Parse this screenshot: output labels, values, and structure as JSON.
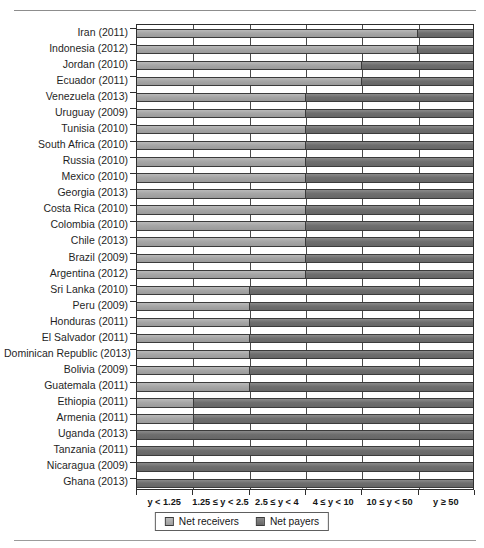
{
  "chart_data": {
    "type": "bar",
    "orientation": "horizontal",
    "stacked": true,
    "title": "",
    "xlabel": "",
    "ylabel": "",
    "grid": true,
    "legend_position": "bottom",
    "categories": [
      "Iran (2011)",
      "Indonesia (2012)",
      "Jordan (2010)",
      "Ecuador (2011)",
      "Venezuela (2013)",
      "Uruguay (2009)",
      "Tunisia (2010)",
      "South Africa (2010)",
      "Russia (2010)",
      "Mexico (2010)",
      "Georgia (2013)",
      "Costa Rica (2010)",
      "Colombia (2010)",
      "Chile (2013)",
      "Brazil (2009)",
      "Argentina (2012)",
      "Sri Lanka (2010)",
      "Peru (2009)",
      "Honduras (2011)",
      "El Salvador (2011)",
      "Dominican Republic (2013)",
      "Bolivia (2009)",
      "Guatemala (2011)",
      "Ethiopia (2011)",
      "Armenia (2011)",
      "Uganda (2013)",
      "Tanzania (2011)",
      "Nicaragua (2009)",
      "Ghana (2013)"
    ],
    "x_tick_labels": [
      "y < 1.25",
      "1.25 ≤ y < 2.5",
      "2.5 ≤ y < 4",
      "4 ≤ y < 10",
      "10 ≤ y < 50",
      "y ≥ 50"
    ],
    "x_band_boundaries": [
      0,
      1,
      2,
      3,
      4,
      5,
      6
    ],
    "xlim": [
      0,
      6
    ],
    "series": [
      {
        "name": "Net receivers",
        "color": "#a6a6a6",
        "values": [
          5,
          5,
          4,
          4,
          3,
          3,
          3,
          3,
          3,
          3,
          3,
          3,
          3,
          3,
          3,
          3,
          2,
          2,
          2,
          2,
          2,
          2,
          2,
          1,
          1,
          0,
          0,
          0,
          0
        ]
      },
      {
        "name": "Net payers",
        "color": "#6e6e6e",
        "values": [
          1,
          1,
          2,
          2,
          3,
          3,
          3,
          3,
          3,
          3,
          3,
          3,
          3,
          3,
          3,
          3,
          4,
          4,
          4,
          4,
          4,
          4,
          4,
          5,
          5,
          6,
          6,
          6,
          6
        ]
      }
    ],
    "crossover_band_index": [
      5,
      5,
      4,
      4,
      3,
      3,
      3,
      3,
      3,
      3,
      3,
      3,
      3,
      3,
      3,
      3,
      2,
      2,
      2,
      2,
      2,
      2,
      2,
      1,
      1,
      0,
      0,
      0,
      0
    ]
  },
  "legend": {
    "items": [
      {
        "label": "Net receivers",
        "swatch": "light"
      },
      {
        "label": "Net payers",
        "swatch": "dark"
      }
    ]
  }
}
